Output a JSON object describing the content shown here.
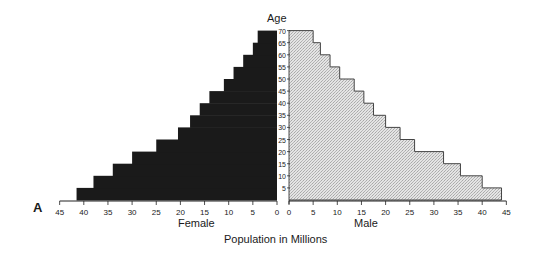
{
  "panel_label": "A",
  "chart_data": {
    "type": "bar",
    "orientation": "horizontal",
    "subtype": "population-pyramid",
    "title": "",
    "ylabel": "Age",
    "xlabel": "Population in Millions",
    "categories": [
      "0-5",
      "5-10",
      "10-15",
      "15-20",
      "20-25",
      "25-30",
      "30-35",
      "35-40",
      "40-45",
      "45-50",
      "50-55",
      "55-60",
      "60-65",
      "65-70"
    ],
    "series": [
      {
        "name": "Female",
        "color": "#1a1a1a",
        "side": "left",
        "values": [
          41.5,
          38,
          34,
          30,
          25,
          20.5,
          18,
          16,
          14,
          11,
          9,
          7,
          5,
          4
        ]
      },
      {
        "name": "Male",
        "color": "#d6d6d6",
        "side": "right",
        "values": [
          44,
          40,
          35.5,
          32,
          26,
          23,
          20,
          17.5,
          15.5,
          13.5,
          10.5,
          8.5,
          6.5,
          5
        ]
      }
    ],
    "age_ticks": [
      5,
      10,
      15,
      20,
      25,
      30,
      35,
      40,
      45,
      50,
      55,
      60,
      65,
      70
    ],
    "female_xticks": [
      45,
      40,
      35,
      30,
      25,
      20,
      15,
      10,
      5,
      0
    ],
    "male_xticks": [
      0,
      5,
      10,
      15,
      20,
      25,
      30,
      35,
      40,
      45
    ],
    "xlim": [
      0,
      45
    ],
    "ylim": [
      0,
      70
    ],
    "grid": false,
    "legend": "side labels below axes"
  },
  "labels": {
    "age_title": "Age",
    "female": "Female",
    "male": "Male",
    "x_title": "Population in Millions"
  }
}
